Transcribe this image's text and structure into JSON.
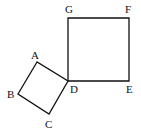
{
  "diagram": {
    "type": "geometry",
    "squares": [
      {
        "name": "ABCD",
        "vertices": [
          "A",
          "B",
          "C",
          "D"
        ]
      },
      {
        "name": "DEFG",
        "vertices": [
          "D",
          "E",
          "F",
          "G"
        ]
      }
    ],
    "points": {
      "A": {
        "label": "A",
        "x": 37,
        "y": 62
      },
      "B": {
        "label": "B",
        "x": 18,
        "y": 94
      },
      "C": {
        "label": "C",
        "x": 49,
        "y": 114
      },
      "D": {
        "label": "D",
        "x": 68,
        "y": 81
      },
      "E": {
        "label": "E",
        "x": 129,
        "y": 81
      },
      "F": {
        "label": "F",
        "x": 129,
        "y": 18
      },
      "G": {
        "label": "G",
        "x": 68,
        "y": 18
      }
    },
    "colors": {
      "stroke": "#111111",
      "background": "#ffffff"
    }
  }
}
